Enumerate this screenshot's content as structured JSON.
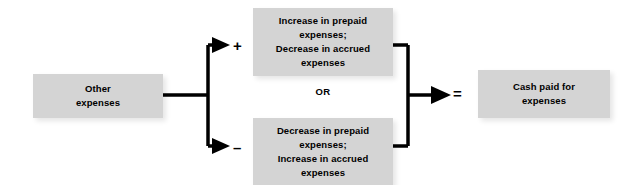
{
  "diagram": {
    "background_color": "#ffffff",
    "box_fill_color": "#d4d4d4",
    "line_color": "#000000",
    "nodes": {
      "source": {
        "id": "other-expenses",
        "lines": [
          "Other",
          "expenses"
        ]
      },
      "branch_positive": {
        "id": "increase-prepaid-decrease-accrued",
        "sign": "+",
        "lines": [
          "Increase in prepaid",
          "expenses;",
          "Decrease in accrued",
          "expenses"
        ]
      },
      "branch_negative": {
        "id": "decrease-prepaid-increase-accrued",
        "sign": "–",
        "lines": [
          "Decrease in prepaid",
          "expenses;",
          "Increase in accrued",
          "expenses"
        ]
      },
      "result": {
        "id": "cash-paid-for-expenses",
        "equals_sign": "=",
        "lines": [
          "Cash paid for",
          "expenses"
        ]
      }
    },
    "connector_label": "OR"
  }
}
